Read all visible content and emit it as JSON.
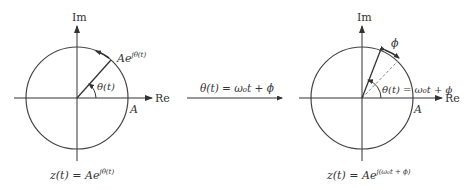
{
  "left_diagram": {
    "axis_im": "Im",
    "axis_re": "Re",
    "radius_label": "A",
    "phasor_label_base": "Ae",
    "phasor_label_exp": "jθ(t)",
    "angle_label": "θ(t)",
    "caption_base": "z(t) = Ae",
    "caption_exp": "jθ(t)"
  },
  "transform_arrow": {
    "label": "θ(t) = ω₀t + ϕ"
  },
  "right_diagram": {
    "axis_im": "Im",
    "axis_re": "Re",
    "radius_label": "A",
    "phase_label": "ϕ",
    "angle_label": "θ(t) = ω₀t + ϕ",
    "caption_base": "z(t) = Ae",
    "caption_exp": "j(ω₀t + ϕ)"
  },
  "colors": {
    "line": "#333333",
    "circle": "#444444",
    "dashed": "#777777"
  }
}
